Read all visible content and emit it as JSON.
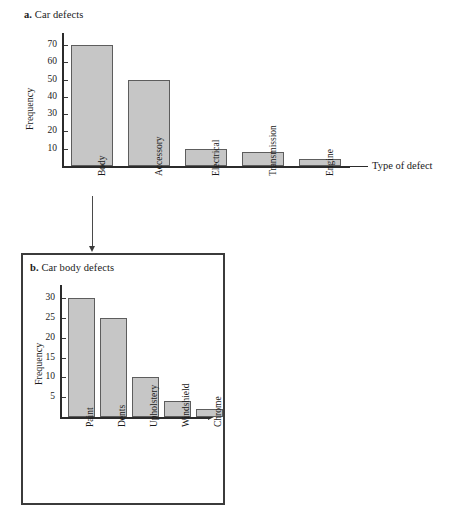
{
  "figure": {
    "panel_a": {
      "label": "a.",
      "title": "Car defects",
      "ylabel": "Frequency",
      "xlabel": "Type of defect"
    },
    "panel_b": {
      "label": "b.",
      "title": "Car body defects",
      "ylabel": "Frequency",
      "xlabel": ""
    },
    "connector": {
      "from": "Body",
      "to": "Car body defects",
      "icon": "down-arrow-icon"
    },
    "colors": {
      "bar_fill": "#c6c6c6",
      "bar_stroke": "#5d5d5d",
      "axis": "#2b2b2b",
      "frame": "#3b3b3b",
      "text": "#1a1a1a"
    }
  },
  "chart_data": [
    {
      "id": "panel-a",
      "type": "bar",
      "title": "a. Car defects",
      "xlabel": "Type of defect",
      "ylabel": "Frequency",
      "categories": [
        "Body",
        "Accessory",
        "Electrical",
        "Transmission",
        "Engine"
      ],
      "values": [
        70,
        50,
        10,
        8,
        4
      ],
      "yticks": [
        10,
        20,
        30,
        40,
        50,
        60,
        70
      ],
      "ytick_labels": [
        "10",
        "20",
        "30",
        "40",
        "50",
        "60",
        "70"
      ],
      "ylim": [
        0,
        75
      ],
      "grid": false,
      "legend": false
    },
    {
      "id": "panel-b",
      "type": "bar",
      "title": "b. Car body defects",
      "xlabel": "",
      "ylabel": "Frequency",
      "categories": [
        "Paint",
        "Dents",
        "Upholstery",
        "Windshield",
        "Chrome"
      ],
      "values": [
        30,
        25,
        10,
        4,
        2
      ],
      "yticks": [
        5,
        10,
        15,
        20,
        25,
        30
      ],
      "ytick_labels": [
        "5",
        "10",
        "15",
        "20",
        "25",
        "30"
      ],
      "ylim": [
        0,
        33
      ],
      "grid": false,
      "legend": false
    }
  ]
}
